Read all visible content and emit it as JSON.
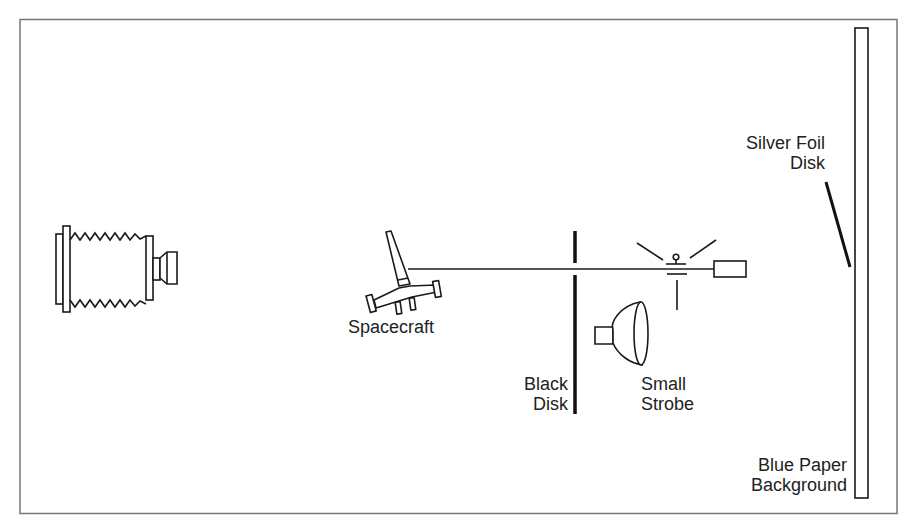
{
  "diagram": {
    "title": "",
    "labels": {
      "spacecraft": "Spacecraft",
      "black_disk_line1": "Black",
      "black_disk_line2": "Disk",
      "small_strobe_line1": "Small",
      "small_strobe_line2": "Strobe",
      "silver_foil_line1": "Silver Foil",
      "silver_foil_line2": "Disk",
      "blue_paper_line1": "Blue Paper",
      "blue_paper_line2": "Background"
    },
    "components": [
      {
        "id": "camera",
        "name": "Bellows camera"
      },
      {
        "id": "spacecraft",
        "name": "Spacecraft model"
      },
      {
        "id": "rod",
        "name": "Support rod"
      },
      {
        "id": "black-disk",
        "name": "Black Disk"
      },
      {
        "id": "mirror-mount",
        "name": "Mount with light rays"
      },
      {
        "id": "small-strobe",
        "name": "Small Strobe"
      },
      {
        "id": "silver-foil-disk",
        "name": "Silver Foil Disk"
      },
      {
        "id": "blue-paper-background",
        "name": "Blue Paper Background"
      }
    ],
    "colors": {
      "ink": "#1a1a1a",
      "frame": "#777777",
      "background": "#ffffff"
    }
  }
}
